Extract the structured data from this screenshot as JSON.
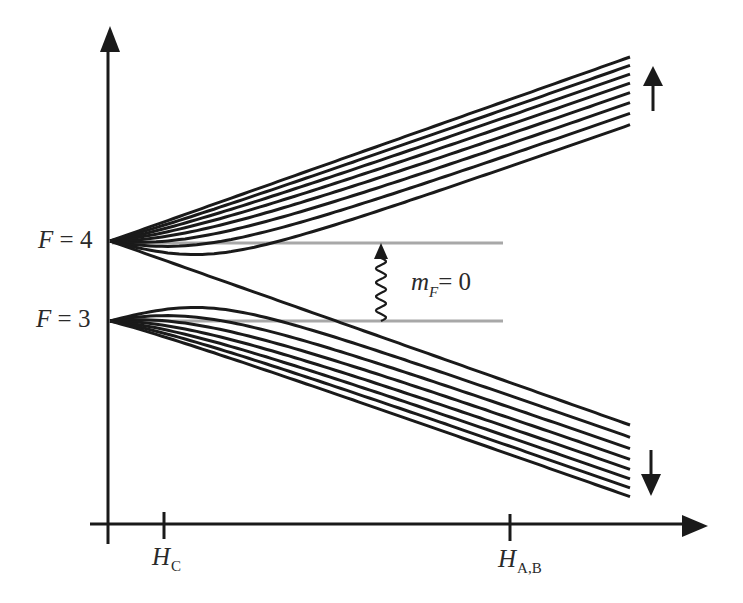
{
  "diagram": {
    "title": "",
    "type": "Breit-Rabi hyperfine level diagram",
    "colors": {
      "lines": "#1a1a1a",
      "reference_lines": "#a8a8a8",
      "text": "#2a2a2a"
    },
    "levels": {
      "upper": {
        "var": "F",
        "eq": " = 4",
        "sublevels": 9
      },
      "lower": {
        "var": "F",
        "eq": " = 3",
        "sublevels": 7
      }
    },
    "transition": {
      "var": "m",
      "sub": "F",
      "eq": "= 0"
    },
    "x_axis": {
      "ticks": [
        {
          "var": "H",
          "sub": "C"
        },
        {
          "var": "H",
          "sub": "A,B"
        }
      ]
    },
    "arrows": {
      "upper_bundle": "up-arrow",
      "lower_bundle": "down-arrow"
    }
  }
}
